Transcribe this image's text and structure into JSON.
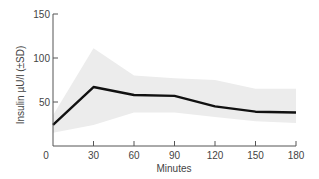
{
  "chart_data": {
    "type": "line",
    "title": "",
    "xlabel": "Minutes",
    "ylabel": "Insulin µU/l (±SD)",
    "x": [
      0,
      30,
      60,
      90,
      120,
      150,
      180
    ],
    "xticks": [
      "0",
      "30",
      "60",
      "90",
      "120",
      "150",
      "180"
    ],
    "yticks": [
      "50",
      "100",
      "150"
    ],
    "xlim": [
      0,
      180
    ],
    "ylim": [
      0,
      150
    ],
    "grid": false,
    "series": [
      {
        "name": "Insulin mean",
        "values": [
          24,
          67,
          58,
          57,
          45,
          39,
          38
        ],
        "color": "#111111"
      },
      {
        "name": "+SD",
        "values": [
          35,
          111,
          80,
          77,
          75,
          65,
          65
        ],
        "color": "#ececec"
      },
      {
        "name": "-SD",
        "values": [
          15,
          24,
          38,
          38,
          33,
          28,
          26
        ],
        "color": "#ececec"
      }
    ]
  }
}
